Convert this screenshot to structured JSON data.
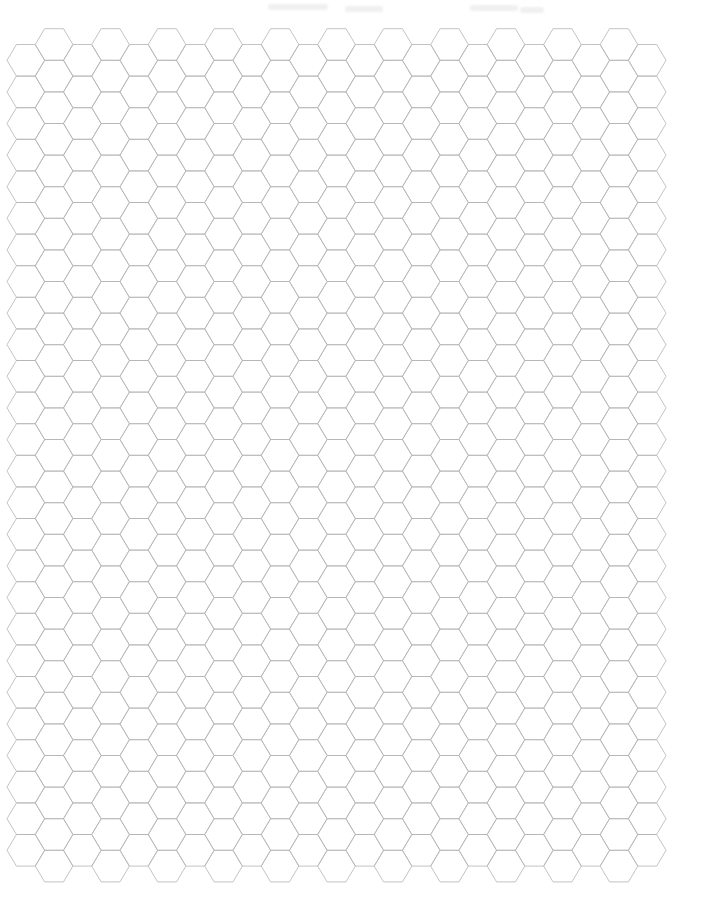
{
  "page": {
    "background": "#ffffff",
    "width": 716,
    "height": 923
  },
  "grid": {
    "orientation": "flat-top",
    "columns": 23,
    "rows_in_lower_columns": 26,
    "rows_in_raised_columns": 27,
    "origin_left_vertex_x": 7,
    "lower_column_top_y": 44.5,
    "raised_column_top_y": 28.7,
    "hex_side": 18.83,
    "hex_height": 31.6,
    "line_color": "#b4b4b4",
    "line_width": 0.8
  },
  "scan_artifacts": [
    {
      "x": 268,
      "y": 4,
      "w": 60
    },
    {
      "x": 345,
      "y": 6,
      "w": 38
    },
    {
      "x": 470,
      "y": 5,
      "w": 48
    },
    {
      "x": 520,
      "y": 7,
      "w": 24
    }
  ]
}
